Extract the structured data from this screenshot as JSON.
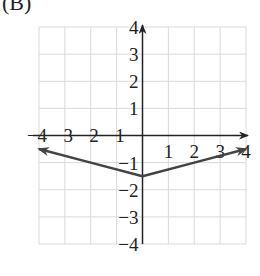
{
  "option_label": "(B)",
  "chart_data": {
    "type": "line",
    "title": "",
    "xlabel": "",
    "ylabel": "",
    "xlim": [
      -4,
      4
    ],
    "ylim": [
      -4,
      4
    ],
    "grid": true,
    "x_ticks": [
      "-4",
      "-3",
      "-2",
      "-1",
      "1",
      "2",
      "3",
      "4"
    ],
    "y_ticks": [
      "4",
      "3",
      "2",
      "1",
      "-1",
      "-2",
      "-3",
      "-4"
    ],
    "series": [
      {
        "name": "f(x)",
        "description": "V-shaped graph with arrows at both ends, vertex at (0, -1.5)",
        "x": [
          -4,
          -2,
          0,
          2,
          4
        ],
        "y": [
          -0.5,
          -1,
          -1.5,
          -1,
          -0.5
        ]
      }
    ],
    "colors": {
      "grid": "#d9d9d9",
      "axes": "#222222",
      "curve": "#444444"
    }
  }
}
